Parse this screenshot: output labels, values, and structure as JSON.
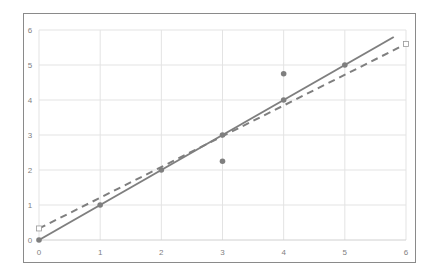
{
  "chart_data": {
    "type": "scatter",
    "title": "",
    "xlabel": "",
    "ylabel": "",
    "xlim": [
      0,
      6
    ],
    "ylim": [
      0,
      6
    ],
    "grid": true,
    "legend": "none",
    "x_ticks": [
      "0",
      "1",
      "2",
      "3",
      "4",
      "5",
      "6"
    ],
    "y_ticks": [
      "0",
      "1",
      "2",
      "3",
      "4",
      "5",
      "6"
    ],
    "series": [
      {
        "name": "points",
        "kind": "scatter",
        "marker": "circle",
        "color": "#7f7f7f",
        "points": [
          [
            0,
            0
          ],
          [
            1,
            1
          ],
          [
            2,
            2
          ],
          [
            3,
            3
          ],
          [
            4,
            4
          ],
          [
            5,
            5
          ],
          [
            3,
            2.25
          ],
          [
            4,
            4.75
          ]
        ]
      },
      {
        "name": "identity line",
        "kind": "line",
        "style": "solid",
        "color": "#7f7f7f",
        "points": [
          [
            0,
            0
          ],
          [
            5.8,
            5.8
          ]
        ]
      },
      {
        "name": "fitted line",
        "kind": "line",
        "style": "dashed",
        "color": "#7f7f7f",
        "endpoint_marker": "hollow-square",
        "points": [
          [
            0,
            0.33
          ],
          [
            6,
            5.6
          ]
        ]
      }
    ]
  }
}
